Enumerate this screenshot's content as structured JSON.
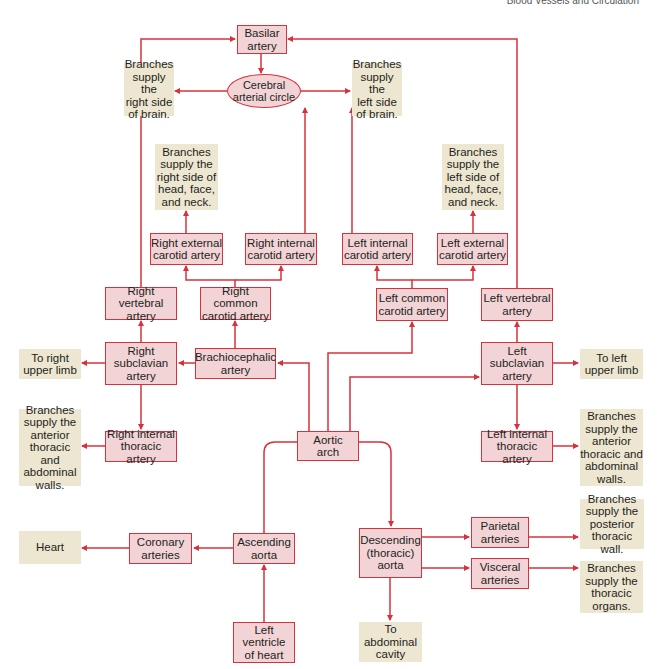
{
  "header": {
    "running_title": "Blood Vessels and Circulation"
  },
  "colors": {
    "line": "#d7323c",
    "artery_fill": "#f2d3d6",
    "note_fill": "#ede6d1"
  },
  "nodes": {
    "basilar": "Basilar\nartery",
    "cerebral": "Cerebral\narterial circle",
    "brain_right": "Branches\nsupply the\nright side\nof brain.",
    "brain_left": "Branches\nsupply the\nleft side\nof brain.",
    "head_right": "Branches\nsupply the\nright side of\nhead, face,\nand neck.",
    "head_left": "Branches\nsupply the\nleft side of\nhead, face,\nand neck.",
    "r_ext_carotid": "Right external\ncarotid artery",
    "r_int_carotid": "Right internal\ncarotid artery",
    "l_int_carotid": "Left internal\ncarotid artery",
    "l_ext_carotid": "Left external\ncarotid artery",
    "r_vertebral": "Right vertebral\nartery",
    "r_common_carotid": "Right common\ncarotid artery",
    "l_common_carotid": "Left common\ncarotid artery",
    "l_vertebral": "Left vertebral\nartery",
    "r_upper_limb": "To right\nupper limb",
    "r_subclavian": "Right\nsubclavian\nartery",
    "brachiocephalic": "Brachiocephalic\nartery",
    "l_subclavian": "Left\nsubclavian\nartery",
    "l_upper_limb": "To left\nupper limb",
    "r_ant_walls": "Branches\nsupply the\nanterior\nthoracic and\nabdominal\nwalls.",
    "r_int_thoracic": "Right internal\nthoracic artery",
    "aortic_arch": "Aortic\narch",
    "l_int_thoracic": "Left internal\nthoracic artery",
    "l_ant_walls": "Branches\nsupply the\nanterior\nthoracic and\nabdominal\nwalls.",
    "heart": "Heart",
    "coronary": "Coronary\narteries",
    "ascending": "Ascending\naorta",
    "descending": "Descending\n(thoracic)\naorta",
    "parietal": "Parietal\narteries",
    "visceral": "Visceral\narteries",
    "post_wall": "Branches\nsupply the\nposterior\nthoracic wall.",
    "thoracic_organs": "Branches\nsupply the\nthoracic\norgans.",
    "left_ventricle": "Left\nventricle\nof heart",
    "abdominal": "To\nabdominal\ncavity"
  }
}
